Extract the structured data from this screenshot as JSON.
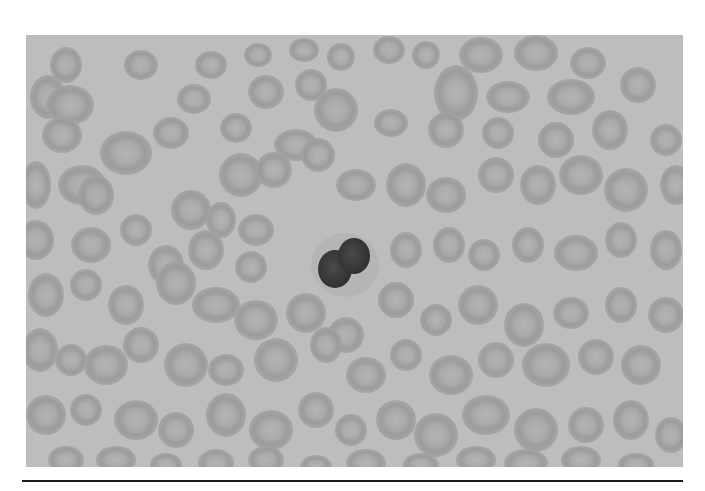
{
  "figure": {
    "colors": {
      "background": "#bdbdbd",
      "rbc_rim": "#989898",
      "rbc_center": "#b0b0b0",
      "nucleus": "#3a3a3a",
      "rule": "#1a1a1a"
    },
    "leukocyte": {
      "cx": 319,
      "cy": 228,
      "lobes": [
        {
          "cx": 309,
          "cy": 234,
          "rx": 17,
          "ry": 19
        },
        {
          "cx": 328,
          "cy": 221,
          "rx": 16,
          "ry": 18
        }
      ]
    },
    "cells": [
      [
        40,
        30,
        16,
        18
      ],
      [
        115,
        30,
        17,
        15
      ],
      [
        185,
        30,
        16,
        14
      ],
      [
        232,
        20,
        14,
        12
      ],
      [
        278,
        15,
        15,
        12
      ],
      [
        315,
        22,
        14,
        14
      ],
      [
        363,
        15,
        16,
        14
      ],
      [
        400,
        20,
        14,
        14
      ],
      [
        455,
        20,
        22,
        18
      ],
      [
        510,
        18,
        22,
        18
      ],
      [
        562,
        28,
        18,
        16
      ],
      [
        22,
        62,
        18,
        22
      ],
      [
        168,
        64,
        17,
        15
      ],
      [
        240,
        57,
        18,
        17
      ],
      [
        285,
        50,
        16,
        16
      ],
      [
        310,
        75,
        22,
        22
      ],
      [
        430,
        58,
        22,
        28
      ],
      [
        482,
        62,
        22,
        16
      ],
      [
        545,
        62,
        24,
        18
      ],
      [
        612,
        50,
        18,
        18
      ],
      [
        44,
        70,
        24,
        20
      ],
      [
        36,
        100,
        20,
        18
      ],
      [
        145,
        98,
        18,
        16
      ],
      [
        100,
        118,
        26,
        22
      ],
      [
        210,
        93,
        16,
        15
      ],
      [
        270,
        110,
        22,
        16
      ],
      [
        292,
        120,
        17,
        17
      ],
      [
        365,
        88,
        17,
        14
      ],
      [
        420,
        95,
        18,
        18
      ],
      [
        472,
        98,
        16,
        16
      ],
      [
        530,
        105,
        18,
        18
      ],
      [
        584,
        95,
        18,
        20
      ],
      [
        640,
        105,
        16,
        16
      ],
      [
        10,
        150,
        15,
        24
      ],
      [
        56,
        150,
        24,
        20
      ],
      [
        70,
        160,
        18,
        20
      ],
      [
        215,
        140,
        22,
        22
      ],
      [
        248,
        135,
        18,
        18
      ],
      [
        195,
        185,
        15,
        18
      ],
      [
        165,
        175,
        20,
        20
      ],
      [
        230,
        195,
        18,
        16
      ],
      [
        330,
        150,
        20,
        16
      ],
      [
        380,
        150,
        20,
        22
      ],
      [
        420,
        160,
        20,
        18
      ],
      [
        470,
        140,
        18,
        18
      ],
      [
        512,
        150,
        18,
        20
      ],
      [
        555,
        140,
        22,
        20
      ],
      [
        600,
        155,
        22,
        22
      ],
      [
        650,
        150,
        16,
        20
      ],
      [
        10,
        205,
        18,
        20
      ],
      [
        65,
        210,
        20,
        18
      ],
      [
        110,
        195,
        16,
        16
      ],
      [
        140,
        230,
        18,
        20
      ],
      [
        180,
        215,
        18,
        20
      ],
      [
        225,
        232,
        16,
        16
      ],
      [
        380,
        215,
        16,
        18
      ],
      [
        423,
        210,
        16,
        18
      ],
      [
        458,
        220,
        16,
        16
      ],
      [
        502,
        210,
        16,
        18
      ],
      [
        550,
        218,
        22,
        18
      ],
      [
        595,
        205,
        16,
        18
      ],
      [
        640,
        215,
        16,
        20
      ],
      [
        20,
        260,
        18,
        22
      ],
      [
        60,
        250,
        16,
        16
      ],
      [
        100,
        270,
        18,
        20
      ],
      [
        150,
        248,
        20,
        22
      ],
      [
        190,
        270,
        24,
        18
      ],
      [
        230,
        285,
        22,
        20
      ],
      [
        280,
        278,
        20,
        20
      ],
      [
        320,
        300,
        18,
        18
      ],
      [
        370,
        265,
        18,
        18
      ],
      [
        410,
        285,
        16,
        16
      ],
      [
        452,
        270,
        20,
        20
      ],
      [
        498,
        290,
        20,
        22
      ],
      [
        545,
        278,
        18,
        16
      ],
      [
        595,
        270,
        16,
        18
      ],
      [
        640,
        280,
        18,
        18
      ],
      [
        14,
        315,
        18,
        22
      ],
      [
        45,
        325,
        16,
        16
      ],
      [
        80,
        330,
        22,
        20
      ],
      [
        115,
        310,
        18,
        18
      ],
      [
        160,
        330,
        22,
        22
      ],
      [
        200,
        335,
        18,
        16
      ],
      [
        250,
        325,
        22,
        22
      ],
      [
        300,
        310,
        16,
        18
      ],
      [
        340,
        340,
        20,
        18
      ],
      [
        380,
        320,
        16,
        16
      ],
      [
        425,
        340,
        22,
        20
      ],
      [
        470,
        325,
        18,
        18
      ],
      [
        520,
        330,
        24,
        22
      ],
      [
        570,
        322,
        18,
        18
      ],
      [
        615,
        330,
        20,
        20
      ],
      [
        20,
        380,
        20,
        20
      ],
      [
        60,
        375,
        16,
        16
      ],
      [
        110,
        385,
        22,
        20
      ],
      [
        150,
        395,
        18,
        18
      ],
      [
        200,
        380,
        20,
        22
      ],
      [
        245,
        395,
        22,
        20
      ],
      [
        290,
        375,
        18,
        18
      ],
      [
        325,
        395,
        16,
        16
      ],
      [
        370,
        385,
        20,
        20
      ],
      [
        410,
        400,
        22,
        22
      ],
      [
        460,
        380,
        24,
        20
      ],
      [
        510,
        395,
        22,
        22
      ],
      [
        560,
        390,
        18,
        18
      ],
      [
        605,
        385,
        18,
        20
      ],
      [
        645,
        400,
        16,
        18
      ],
      [
        40,
        425,
        18,
        14
      ],
      [
        90,
        425,
        20,
        14
      ],
      [
        140,
        430,
        16,
        12
      ],
      [
        190,
        428,
        18,
        14
      ],
      [
        240,
        425,
        18,
        14
      ],
      [
        290,
        432,
        16,
        12
      ],
      [
        340,
        428,
        20,
        14
      ],
      [
        395,
        430,
        18,
        12
      ],
      [
        450,
        425,
        20,
        14
      ],
      [
        500,
        428,
        22,
        14
      ],
      [
        555,
        425,
        20,
        14
      ],
      [
        610,
        430,
        18,
        12
      ]
    ]
  }
}
